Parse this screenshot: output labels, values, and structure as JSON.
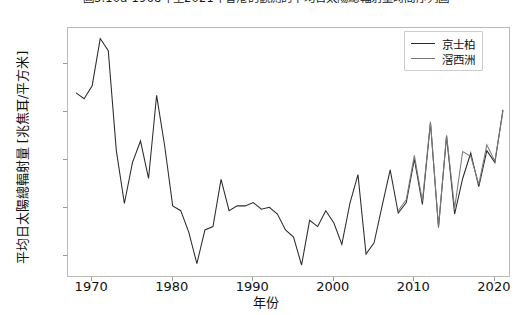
{
  "chart_data": {
    "type": "line",
    "title": "圖3.10a  1968年至2021年香港的觀測的平均日太陽總輻射量時間序列圖",
    "xlabel": "年份",
    "ylabel": "平均日太陽總輻射量 [兆焦耳/平方米]",
    "xlim": [
      1967,
      2022
    ],
    "ylim": [
      11.55,
      16.75
    ],
    "xticks": [
      1970,
      1980,
      1990,
      2000,
      2010,
      2020
    ],
    "yticks": [
      12,
      13,
      14,
      15,
      16
    ],
    "grid": false,
    "legend_position": "upper right",
    "series": [
      {
        "name": "京士柏",
        "color": "#2b2b2b",
        "x": [
          1968,
          1969,
          1970,
          1971,
          1972,
          1973,
          1974,
          1975,
          1976,
          1977,
          1978,
          1979,
          1980,
          1981,
          1982,
          1983,
          1984,
          1985,
          1986,
          1987,
          1988,
          1989,
          1990,
          1991,
          1992,
          1993,
          1994,
          1995,
          1996,
          1997,
          1998,
          1999,
          2000,
          2001,
          2002,
          2003,
          2004,
          2005,
          2006,
          2007,
          2008,
          2009,
          2010,
          2011,
          2012,
          2013,
          2014,
          2015,
          2016,
          2017,
          2018,
          2019,
          2020,
          2021
        ],
        "values": [
          15.4,
          15.28,
          15.55,
          16.53,
          16.28,
          14.2,
          13.1,
          13.95,
          14.4,
          13.62,
          15.35,
          14.3,
          13.05,
          12.95,
          12.5,
          11.85,
          12.55,
          12.62,
          13.6,
          12.95,
          13.05,
          13.05,
          13.12,
          12.98,
          13.02,
          12.88,
          12.55,
          12.4,
          11.82,
          12.75,
          12.62,
          12.95,
          12.7,
          12.25,
          13.1,
          13.7,
          12.05,
          12.28,
          13.05,
          13.8,
          12.9,
          13.12,
          14.02,
          13.08,
          14.78,
          12.6,
          14.5,
          12.88,
          13.62,
          14.15,
          13.45,
          14.2,
          13.95,
          15.05
        ]
      },
      {
        "name": "滘西洲",
        "color": "#7a7a7a",
        "x": [
          2008,
          2009,
          2010,
          2011,
          2012,
          2013,
          2014,
          2015,
          2016,
          2017,
          2018,
          2019,
          2020,
          2021
        ],
        "values": [
          12.95,
          13.18,
          14.1,
          13.15,
          14.8,
          12.62,
          14.52,
          13.0,
          14.18,
          14.08,
          13.5,
          14.32,
          13.98,
          15.02
        ]
      }
    ]
  },
  "legend": {
    "items": [
      {
        "label": "京士柏",
        "color": "#2b2b2b"
      },
      {
        "label": "滘西洲",
        "color": "#7a7a7a"
      }
    ]
  }
}
